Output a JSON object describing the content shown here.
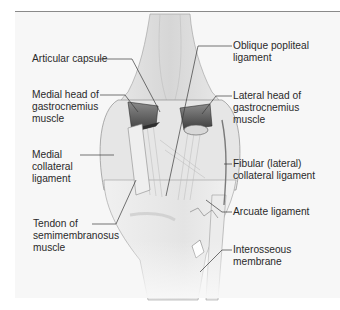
{
  "figure": {
    "colors": {
      "background": "#f7f7f7",
      "leader_line": "#3a3a3a",
      "label_text": "#2a2a2a",
      "muscle_dark": "#4a4a4a",
      "bone_light": "#ececec"
    },
    "labels_left": [
      {
        "id": "articular-capsule",
        "text": "Articular capsule"
      },
      {
        "id": "medial-head-gastrocnemius",
        "text": "Medial head of\ngastrocnemius\nmuscle"
      },
      {
        "id": "medial-collateral-ligament",
        "text": "Medial\ncollateral\nligament"
      },
      {
        "id": "tendon-semimembranosus",
        "text": "Tendon of\nsemimembranosus\nmuscle"
      }
    ],
    "labels_right": [
      {
        "id": "oblique-popliteal-ligament",
        "text": "Oblique popliteal\nligament"
      },
      {
        "id": "lateral-head-gastrocnemius",
        "text": "Lateral head of\ngastrocnemius\nmuscle"
      },
      {
        "id": "fibular-collateral-ligament",
        "text": "Fibular (lateral)\ncollateral ligament"
      },
      {
        "id": "arcuate-ligament",
        "text": "Arcuate ligament"
      },
      {
        "id": "interosseous-membrane",
        "text": "Interosseous\nmembrane"
      }
    ]
  }
}
